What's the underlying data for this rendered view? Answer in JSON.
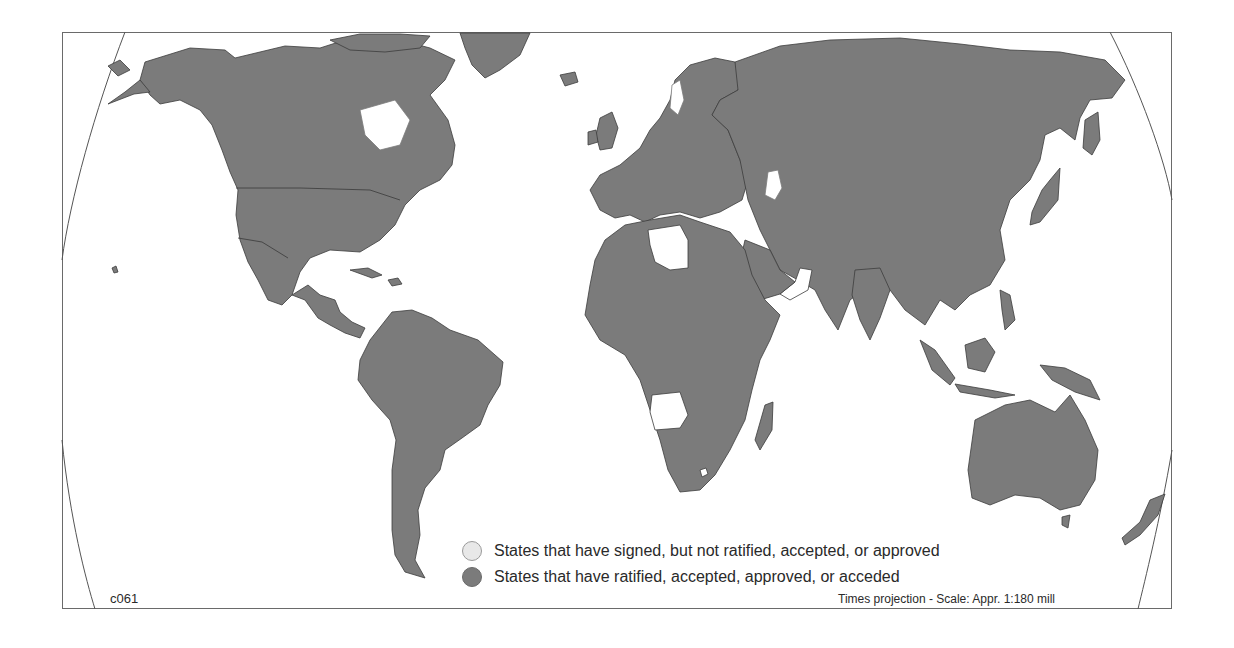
{
  "map": {
    "title": "",
    "projection_note": "Times projection - Scale: Appr. 1:180 mill",
    "code": "c061",
    "colors": {
      "ratified": "#7b7b7b",
      "signed_not_ratified": "#e8e8e8",
      "signed_fill_on_map": "#ffffff",
      "border": "#3c3c3c",
      "frame": "#6a6a6a"
    },
    "legend": [
      {
        "symbol": "light-circle",
        "label": "States that have signed, but not ratified, accepted, or approved"
      },
      {
        "symbol": "dark-circle",
        "label": "States that have ratified, accepted, approved, or acceded"
      }
    ],
    "regions_signed_not_ratified_visible": [
      "Libya",
      "Israel/Lebanon area",
      "Yemen/Oman coast",
      "Angola",
      "Lesotho (enclave)"
    ]
  }
}
